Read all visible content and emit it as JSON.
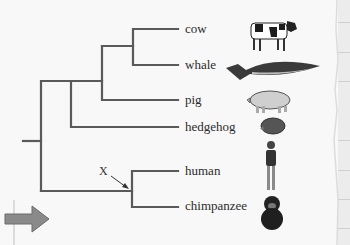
{
  "diagram": {
    "type": "phylogenetic-tree",
    "taxa": [
      {
        "label": "cow",
        "icon": "cow-icon"
      },
      {
        "label": "whale",
        "icon": "whale-icon"
      },
      {
        "label": "pig",
        "icon": "pig-icon"
      },
      {
        "label": "hedgehog",
        "icon": "hedgehog-icon"
      },
      {
        "label": "human",
        "icon": "human-icon"
      },
      {
        "label": "chimpanzee",
        "icon": "chimpanzee-icon"
      }
    ],
    "node_marker": {
      "label": "X",
      "points_to": "human-chimpanzee common ancestor"
    },
    "structure": "((((cow,whale),pig),hedgehog),(human,chimpanzee))",
    "line_color": "#5a5a5a"
  }
}
